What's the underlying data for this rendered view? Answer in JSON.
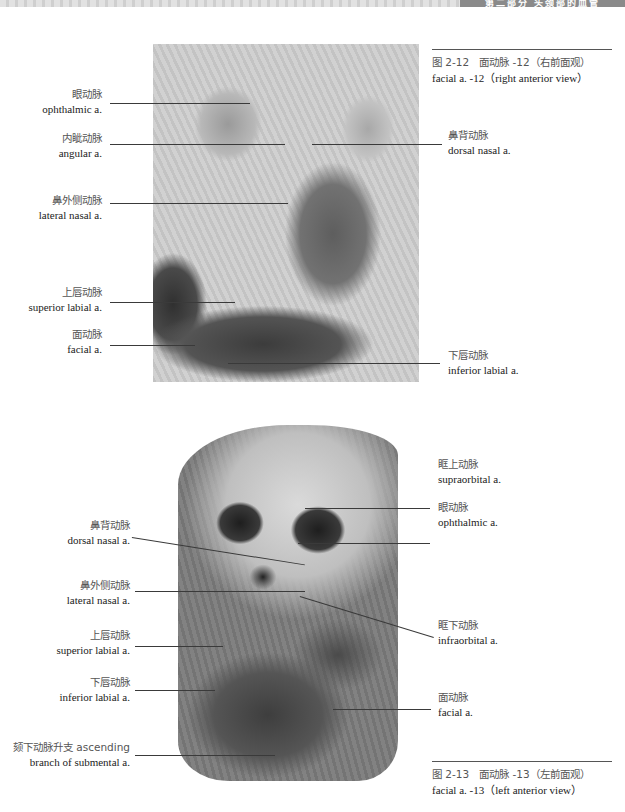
{
  "header": {
    "running_title": "第二部分 头颈部的血管",
    "band_color": "#8a8a8a"
  },
  "figure_2_12": {
    "caption": {
      "zh": "图 2-12　面动脉 -12（右前面观）",
      "en": "facial a. -12（right anterior view）"
    },
    "labels_left": [
      {
        "zh": "眼动脉",
        "en": "ophthalmic a."
      },
      {
        "zh": "内眦动脉",
        "en": "angular a."
      },
      {
        "zh": "鼻外侧动脉",
        "en": "lateral nasal a."
      },
      {
        "zh": "上唇动脉",
        "en": "superior labial a."
      },
      {
        "zh": "面动脉",
        "en": "facial a."
      }
    ],
    "labels_right": [
      {
        "zh": "鼻背动脉",
        "en": "dorsal nasal a."
      },
      {
        "zh": "下唇动脉",
        "en": "inferior labial a."
      }
    ]
  },
  "figure_2_13": {
    "caption": {
      "zh": "图 2-13　面动脉 -13（左前面观）",
      "en": "facial a. -13（left anterior view）"
    },
    "labels_left": [
      {
        "zh": "鼻背动脉",
        "en": "dorsal nasal a."
      },
      {
        "zh": "鼻外侧动脉",
        "en": "lateral nasal a."
      },
      {
        "zh": "上唇动脉",
        "en": "superior labial a."
      },
      {
        "zh": "下唇动脉",
        "en": "inferior labial a."
      },
      {
        "zh": "颏下动脉升支 ascending",
        "en": "branch of submental a."
      }
    ],
    "labels_right": [
      {
        "zh": "眶上动脉",
        "en": "supraorbital a."
      },
      {
        "zh": "眼动脉",
        "en": "ophthalmic a."
      },
      {
        "zh": "眶下动脉",
        "en": "infraorbital a."
      },
      {
        "zh": "面动脉",
        "en": "facial a."
      }
    ]
  }
}
